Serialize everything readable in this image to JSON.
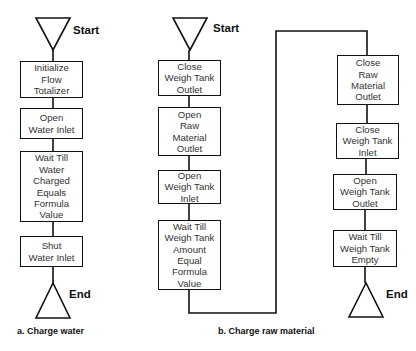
{
  "diagram_a": {
    "caption": "a. Charge water",
    "start_label": "Start",
    "end_label": "End",
    "steps": [
      {
        "lines": [
          "Initialize",
          "Flow",
          "Totalizer"
        ]
      },
      {
        "lines": [
          "Open",
          "Water Inlet"
        ]
      },
      {
        "lines": [
          "Wait Till",
          "Water",
          "Charged",
          "Equals",
          "Formula",
          "Value"
        ]
      },
      {
        "lines": [
          "Shut",
          "Water Inlet"
        ]
      }
    ]
  },
  "diagram_b": {
    "caption": "b. Charge raw material",
    "start_label": "Start",
    "end_label": "End",
    "steps": [
      {
        "lines": [
          "Close",
          "Weigh Tank",
          "Outlet"
        ]
      },
      {
        "lines": [
          "Open",
          "Raw",
          "Material",
          "Outlet"
        ]
      },
      {
        "lines": [
          "Open",
          "Weigh Tank",
          "Inlet"
        ]
      },
      {
        "lines": [
          "Wait Till",
          "Weigh Tank",
          "Amount",
          "Equal",
          "Formula",
          "Value"
        ]
      },
      {
        "lines": [
          "Close",
          "Raw",
          "Material",
          "Outlet"
        ]
      },
      {
        "lines": [
          "Close",
          "Weigh Tank",
          "Inlet"
        ]
      },
      {
        "lines": [
          "Open",
          "Weigh Tank",
          "Outlet"
        ]
      },
      {
        "lines": [
          "Wait Till",
          "Weigh Tank",
          "Empty"
        ]
      }
    ]
  },
  "colors": {
    "line": "#111111",
    "text": "#333333",
    "background": "#ffffff"
  }
}
